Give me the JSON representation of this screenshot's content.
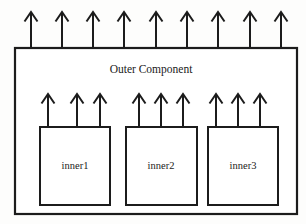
{
  "diagram": {
    "title": "Outer Component",
    "background_color": "#fdfdfc",
    "stroke_color": "#1c1c1c",
    "fill_color": "#ffffff",
    "outer": {
      "label": "Outer Component",
      "x": 15,
      "y": 48,
      "width": 282,
      "height": 166,
      "label_x": 151,
      "label_y": 70,
      "outgoing_arrow_count": 9,
      "outgoing_arrows": [
        {
          "x": 31,
          "y_top": 12,
          "y_bottom": 48
        },
        {
          "x": 62,
          "y_top": 12,
          "y_bottom": 48
        },
        {
          "x": 93,
          "y_top": 12,
          "y_bottom": 48
        },
        {
          "x": 124,
          "y_top": 12,
          "y_bottom": 48
        },
        {
          "x": 156,
          "y_top": 12,
          "y_bottom": 48
        },
        {
          "x": 187,
          "y_top": 12,
          "y_bottom": 48
        },
        {
          "x": 218,
          "y_top": 12,
          "y_bottom": 48
        },
        {
          "x": 250,
          "y_top": 12,
          "y_bottom": 48
        },
        {
          "x": 281,
          "y_top": 12,
          "y_bottom": 48
        }
      ]
    },
    "inner_components": [
      {
        "label": "inner1",
        "x": 40,
        "y": 127,
        "width": 70,
        "height": 78,
        "label_x": 75,
        "label_y": 167,
        "arrows": [
          {
            "x": 48,
            "y_top": 94,
            "y_bottom": 127
          },
          {
            "x": 77,
            "y_top": 94,
            "y_bottom": 127
          },
          {
            "x": 100,
            "y_top": 94,
            "y_bottom": 127
          }
        ]
      },
      {
        "label": "inner2",
        "x": 126,
        "y": 127,
        "width": 71,
        "height": 78,
        "label_x": 161,
        "label_y": 167,
        "arrows": [
          {
            "x": 139,
            "y_top": 94,
            "y_bottom": 127
          },
          {
            "x": 161,
            "y_top": 94,
            "y_bottom": 127
          },
          {
            "x": 183,
            "y_top": 94,
            "y_bottom": 127
          }
        ]
      },
      {
        "label": "inner3",
        "x": 208,
        "y": 127,
        "width": 70,
        "height": 78,
        "label_x": 243,
        "label_y": 167,
        "arrows": [
          {
            "x": 216,
            "y_top": 94,
            "y_bottom": 127
          },
          {
            "x": 238,
            "y_top": 94,
            "y_bottom": 127
          },
          {
            "x": 260,
            "y_top": 94,
            "y_bottom": 127
          }
        ]
      }
    ],
    "arrow_head": {
      "half_width": 6.5,
      "height": 9.5,
      "style": "open-chevron"
    }
  }
}
